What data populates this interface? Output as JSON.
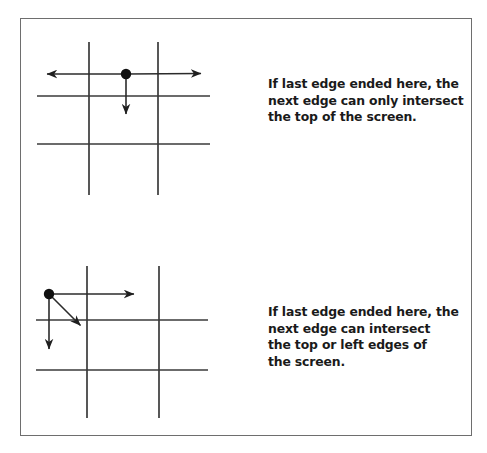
{
  "figure": {
    "background_color": "#ffffff",
    "border_color": "#6e6e6e",
    "ink_color": "#2b2b2b",
    "text_color": "#1a1a1a"
  },
  "captions": {
    "top": "If last edge ended here, the\nnext edge can only intersect\nthe top of the screen.",
    "bottom": "If last edge ended here, the\nnext edge can intersect\nthe top or left edges of\nthe screen."
  },
  "diagrams": [
    {
      "id": "top-grid-diagram",
      "name": "corner-vertex-single-direction",
      "grid": {
        "vertical_lines_x": [
          89,
          158
        ],
        "vertical_span_y": [
          42,
          195
        ],
        "horizontal_lines_y": [
          96,
          144
        ],
        "horizontal_span_x": [
          37,
          210
        ]
      },
      "vertex": {
        "x": 126,
        "y": 74,
        "radius": 5
      },
      "arrows": [
        {
          "name": "left-arrow",
          "x1": 126,
          "y1": 74,
          "x2": 41,
          "y2": 74
        },
        {
          "name": "right-arrow",
          "x1": 126,
          "y1": 74,
          "x2": 207,
          "y2": 73
        },
        {
          "name": "down-arrow",
          "x1": 126,
          "y1": 74,
          "x2": 126,
          "y2": 122
        }
      ]
    },
    {
      "id": "bottom-grid-diagram",
      "name": "corner-vertex-two-directions",
      "grid": {
        "vertical_lines_x": [
          87,
          159
        ],
        "vertical_span_y": [
          266,
          418
        ],
        "horizontal_lines_y": [
          320,
          370
        ],
        "horizontal_span_x": [
          36,
          208
        ]
      },
      "vertex": {
        "x": 49,
        "y": 294,
        "radius": 5
      },
      "arrows": [
        {
          "name": "right-arrow",
          "x1": 49,
          "y1": 294,
          "x2": 140,
          "y2": 294
        },
        {
          "name": "diagonal-arrow",
          "x1": 49,
          "y1": 294,
          "x2": 85,
          "y2": 330
        },
        {
          "name": "down-arrow",
          "x1": 49,
          "y1": 294,
          "x2": 49,
          "y2": 357
        }
      ]
    }
  ]
}
